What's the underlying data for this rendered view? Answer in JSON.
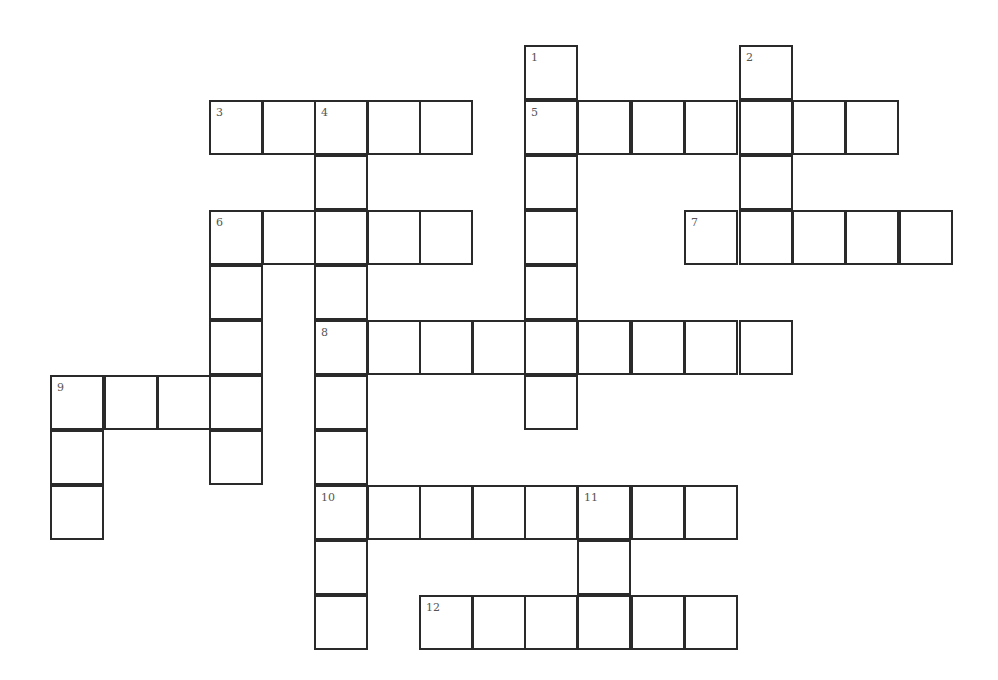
{
  "puzzle": {
    "type": "crossword",
    "cell_color": "#ffffff",
    "border_color": "#2a2a2a",
    "col_x": [
      51,
      105,
      158,
      210,
      263,
      315,
      368,
      420,
      473,
      525,
      578,
      632,
      685,
      740,
      793,
      846,
      900
    ],
    "row_y": [
      46,
      101,
      156,
      211,
      266,
      321,
      376,
      431,
      486,
      541,
      596
    ],
    "entries": [
      {
        "number": "1",
        "direction": "down",
        "row": 0,
        "col": 9,
        "length": 7
      },
      {
        "number": "2",
        "direction": "down",
        "row": 0,
        "col": 13,
        "length": 4
      },
      {
        "number": "3",
        "direction": "across",
        "row": 1,
        "col": 3,
        "length": 5
      },
      {
        "number": "4",
        "direction": "down",
        "row": 1,
        "col": 5,
        "length": 10
      },
      {
        "number": "5",
        "direction": "across",
        "row": 1,
        "col": 9,
        "length": 7
      },
      {
        "number": "6",
        "direction": "across",
        "row": 3,
        "col": 3,
        "length": 5
      },
      {
        "number": "6",
        "direction": "down",
        "row": 3,
        "col": 3,
        "length": 5
      },
      {
        "number": "7",
        "direction": "across",
        "row": 3,
        "col": 12,
        "length": 5
      },
      {
        "number": "8",
        "direction": "across",
        "row": 5,
        "col": 5,
        "length": 9
      },
      {
        "number": "9",
        "direction": "across",
        "row": 6,
        "col": 0,
        "length": 4
      },
      {
        "number": "9",
        "direction": "down",
        "row": 6,
        "col": 0,
        "length": 3
      },
      {
        "number": "10",
        "direction": "across",
        "row": 8,
        "col": 5,
        "length": 8
      },
      {
        "number": "11",
        "direction": "down",
        "row": 8,
        "col": 10,
        "length": 3
      },
      {
        "number": "12",
        "direction": "across",
        "row": 10,
        "col": 7,
        "length": 6
      }
    ]
  }
}
